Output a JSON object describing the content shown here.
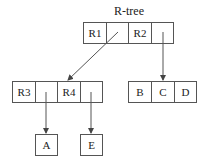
{
  "title": "R-tree",
  "root": {
    "cells": [
      "R1",
      "",
      "R2",
      ""
    ]
  },
  "left_node": {
    "cells": [
      "R3",
      "",
      "R4",
      ""
    ]
  },
  "right_node": {
    "cells": [
      "B",
      "C",
      "D"
    ]
  },
  "leaves": {
    "a": "A",
    "e": "E"
  },
  "colors": {
    "line": "#555555",
    "text": "#222222"
  }
}
